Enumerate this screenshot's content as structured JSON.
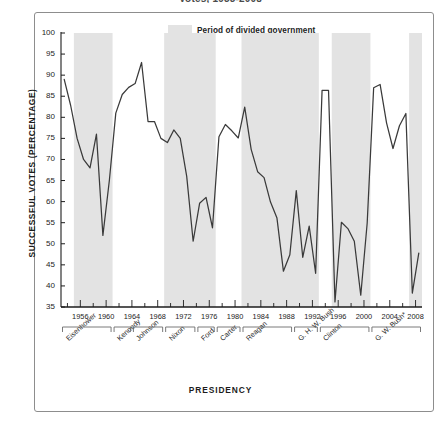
{
  "figure": {
    "title": "Votes, 1953-2008",
    "legend_label": "Period of divided government",
    "legend_swatch_color": "#e3e3e3",
    "line_color": "#3a3a3a",
    "frame_color": "#8d8d8d"
  },
  "chart_data": {
    "type": "line",
    "title": "Votes, 1953-2008",
    "xlabel": "PRESIDENCY",
    "ylabel": "SUCCESSFUL VOTES (PERCENTAGE)",
    "ylim": [
      35,
      100
    ],
    "xlim": [
      1953,
      2008
    ],
    "ytick_values": [
      35,
      40,
      45,
      50,
      55,
      60,
      65,
      70,
      75,
      80,
      85,
      90,
      95,
      100
    ],
    "xtick_values": [
      1956,
      1960,
      1964,
      1968,
      1972,
      1976,
      1980,
      1984,
      1988,
      1992,
      1996,
      2000,
      2004,
      2008
    ],
    "minor_tick_step": 2,
    "grid": false,
    "legend_position": "top-center",
    "series_name": "Presidential success rate on congressional votes",
    "x": [
      1953,
      1954,
      1955,
      1956,
      1957,
      1958,
      1959,
      1960,
      1961,
      1962,
      1963,
      1964,
      1965,
      1966,
      1967,
      1968,
      1969,
      1970,
      1971,
      1972,
      1973,
      1974,
      1975,
      1976,
      1977,
      1978,
      1979,
      1980,
      1981,
      1982,
      1983,
      1984,
      1985,
      1986,
      1987,
      1988,
      1989,
      1990,
      1991,
      1992,
      1993,
      1994,
      1995,
      1996,
      1997,
      1998,
      1999,
      2000,
      2001,
      2002,
      2003,
      2004,
      2005,
      2006,
      2007,
      2008
    ],
    "y": [
      89.0,
      82.8,
      75.0,
      70.0,
      68.0,
      76.0,
      52.0,
      65.0,
      81.0,
      85.4,
      87.1,
      88.0,
      93.0,
      79.0,
      79.0,
      75.0,
      74.0,
      77.0,
      75.0,
      66.0,
      50.6,
      59.6,
      61.0,
      53.8,
      75.4,
      78.3,
      76.8,
      75.1,
      82.4,
      72.4,
      67.1,
      65.7,
      59.9,
      56.1,
      43.5,
      47.4,
      62.6,
      46.8,
      54.2,
      43.0,
      86.4,
      86.4,
      36.2,
      55.1,
      53.6,
      50.6,
      37.8,
      55.0,
      87.0,
      87.8,
      78.7,
      72.6,
      78.0,
      80.9,
      38.3,
      47.8
    ],
    "divided_government_periods": [
      {
        "start": 1955,
        "end": 1961
      },
      {
        "start": 1969,
        "end": 1977
      },
      {
        "start": 1981,
        "end": 1993
      },
      {
        "start": 1995,
        "end": 2001
      },
      {
        "start": 2007,
        "end": 2009
      }
    ],
    "presidents": [
      {
        "name": "Eisenhower",
        "start": 1953,
        "end": 1961
      },
      {
        "name": "Kennedy",
        "start": 1961,
        "end": 1964
      },
      {
        "name": "Johnson",
        "start": 1964,
        "end": 1969
      },
      {
        "name": "Nixon",
        "start": 1969,
        "end": 1974
      },
      {
        "name": "Ford",
        "start": 1974,
        "end": 1977
      },
      {
        "name": "Carter",
        "start": 1977,
        "end": 1981
      },
      {
        "name": "Reagan",
        "start": 1981,
        "end": 1989
      },
      {
        "name": "G. H. W. Bush",
        "start": 1989,
        "end": 1993
      },
      {
        "name": "Clinton",
        "start": 1993,
        "end": 2001
      },
      {
        "name": "G. W. Bush*",
        "start": 2001,
        "end": 2009
      }
    ]
  }
}
